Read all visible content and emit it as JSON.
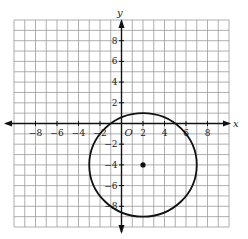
{
  "chart_data": {
    "type": "scatter",
    "title": "",
    "xlabel": "x",
    "ylabel": "y",
    "origin_label": "O",
    "xlim": [
      -10,
      10
    ],
    "ylim": [
      -10,
      10
    ],
    "grid": true,
    "x_ticks": [
      -8,
      -6,
      -4,
      -2,
      2,
      4,
      6,
      8
    ],
    "x_tick_labels": [
      "−8",
      "−6",
      "−4",
      "−2",
      "2",
      "4",
      "6",
      "8"
    ],
    "y_ticks": [
      8,
      6,
      4,
      2,
      -2,
      -4,
      -6,
      -8
    ],
    "y_tick_labels": [
      "8",
      "6",
      "4",
      "2",
      "−2",
      "−4",
      "−6",
      "−8"
    ],
    "shapes": [
      {
        "type": "circle",
        "center": [
          2,
          -4
        ],
        "radius": 5
      }
    ],
    "points": [
      {
        "x": 2,
        "y": -4,
        "label": "center"
      }
    ],
    "colors": {
      "grid": "#9a9a9a",
      "axis": "#111111",
      "curve": "#111111"
    }
  }
}
